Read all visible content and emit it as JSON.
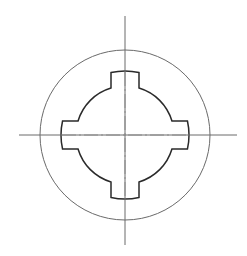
{
  "diagram": {
    "title": "",
    "spline_count": 4,
    "colors": {
      "outline": "#2a2a2a",
      "thin_line": "#6a6a6a",
      "center_line": "#8a8a8a",
      "background": "#ffffff"
    },
    "labels": []
  }
}
